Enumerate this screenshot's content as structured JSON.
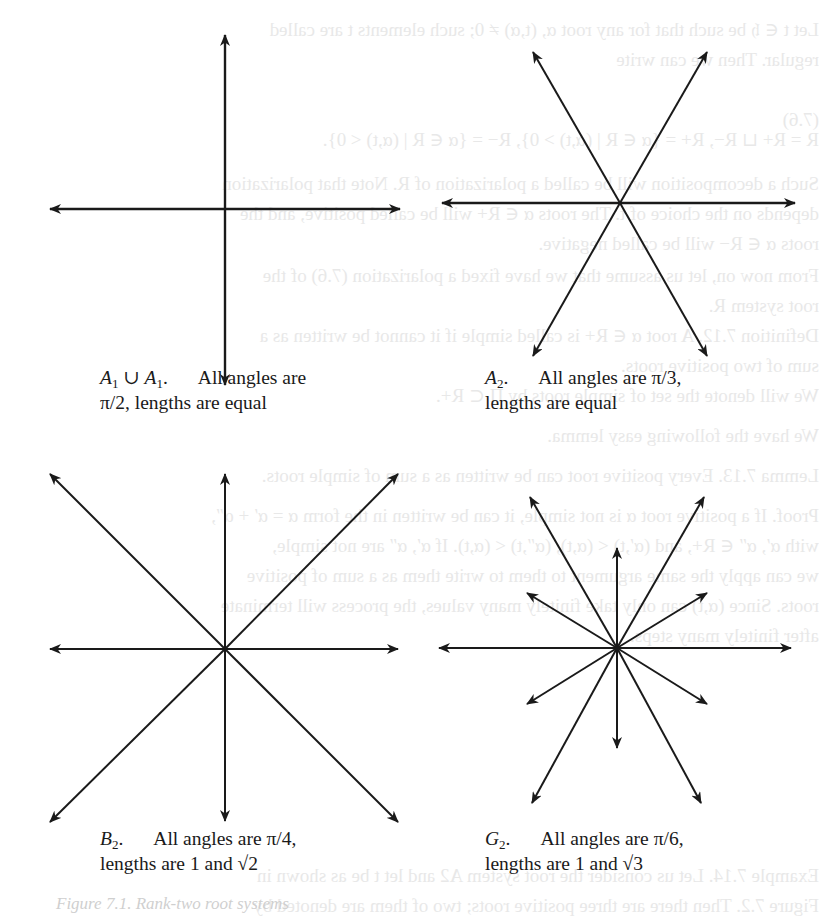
{
  "figures": [
    {
      "id": "A1xA1",
      "name_main": "A",
      "name_sub": "1",
      "union": " ∪ ",
      "name2_main": "A",
      "name2_sub": "1",
      "line1_text": "All angles are",
      "line2_text": "π/2, lengths are equal",
      "center": [
        225,
        209
      ],
      "roots": [
        [
          0,
          -174
        ],
        [
          0,
          176
        ],
        [
          -175,
          0
        ],
        [
          175,
          0
        ]
      ]
    },
    {
      "id": "A2",
      "name_main": "A",
      "name_sub": "2",
      "line1_text": "All angles are π/3,",
      "line2_text": "lengths are equal",
      "center": [
        620,
        203
      ],
      "roots": [
        [
          175,
          0
        ],
        [
          -178,
          0
        ],
        [
          87,
          -151
        ],
        [
          -87,
          -151
        ],
        [
          87,
          153
        ],
        [
          -87,
          153
        ]
      ]
    },
    {
      "id": "B2",
      "name_main": "B",
      "name_sub": "2",
      "line1_text": "All angles are π/4,",
      "line2_text": "lengths are 1 and √2",
      "center": [
        225,
        649
      ],
      "roots": [
        [
          0,
          -175
        ],
        [
          0,
          172
        ],
        [
          -175,
          0
        ],
        [
          173,
          0
        ],
        [
          -175,
          -175
        ],
        [
          173,
          -175
        ],
        [
          -175,
          173
        ],
        [
          173,
          173
        ]
      ]
    },
    {
      "id": "G2",
      "name_main": "G",
      "name_sub": "2",
      "line1_text": "All angles are π/6,",
      "line2_text": "lengths are 1 and √3",
      "center": [
        617,
        648
      ],
      "roots": [
        [
          174,
          0
        ],
        [
          -178,
          0
        ],
        [
          0,
          -100
        ],
        [
          0,
          100
        ],
        [
          90,
          -55
        ],
        [
          -90,
          -55
        ],
        [
          90,
          56
        ],
        [
          -90,
          56
        ],
        [
          87,
          -151
        ],
        [
          -87,
          -151
        ],
        [
          84,
          155
        ],
        [
          -85,
          155
        ]
      ]
    }
  ],
  "figure_caption_partial": "Figure 7.1. Rank-two root systems",
  "bleed_through_text": [
    "Let t ∈ 𝔥 be such that for any root α, (t,α) ≠ 0; such elements t are called",
    "regular. Then we can write",
    "(7.6)",
    "R = R+ ⊔ R−,   R+ = {α ∈ R | (α,t) > 0},   R− = {α ∈ R | (α,t) < 0}.",
    "Such a decomposition will be called a polarization of R. Note that polarization",
    "depends on the choice of t. The roots α ∈ R+ will be called positive, and the",
    "roots α ∈ R− will be called negative.",
    "From now on, let us assume that we have fixed a polarization (7.6) of the",
    "root system R.",
    "Definition 7.12. A root α ∈ R+ is called simple if it cannot be written as a",
    "sum of two positive roots.",
    "We will denote the set of simple roots by Π ⊂ R+.",
    "We have the following easy lemma.",
    "Lemma 7.13. Every positive root can be written as a sum of simple roots.",
    "Proof. If a positive root α is not simple, it can be written in the form α = α′ + α″,",
    "with α′, α″ ∈ R+, and (α′,t) < (α,t), (α″,t) < (α,t). If α′, α″ are not simple,",
    "we can apply the same argument to them to write them as a sum of positive",
    "roots. Since (α,t) can only take finitely many values, the process will terminate",
    "after finitely many steps.",
    "Example 7.14. Let us consider the root system A2 and let t be as shown in",
    "Figure 7.2. Then there are three positive roots; two of them are denoted by"
  ],
  "colors": {
    "ink": "#1a1a1a",
    "bleed": "#d6d6d6",
    "background": "#ffffff"
  }
}
